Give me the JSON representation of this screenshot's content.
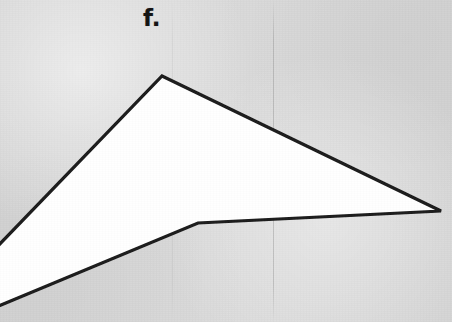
{
  "canvas": {
    "width": 452,
    "height": 322,
    "background_color": "#d8d8d8",
    "description": "Scanned worksheet page region showing one labeled geometric figure"
  },
  "label": {
    "text": "f.",
    "x": 143,
    "y": 7,
    "font_size_px": 23,
    "bold": true,
    "color": "#131313"
  },
  "figure": {
    "name": "concave-quadrilateral",
    "fill_color": "#ffffff",
    "stroke_color": "#1a1a1a",
    "stroke_width": 3.2,
    "clipped_at_left_edge": true,
    "points": [
      {
        "name": "left-upper-edge-exit",
        "x": -34,
        "y": 279
      },
      {
        "name": "apex-top",
        "x": 162,
        "y": 76
      },
      {
        "name": "right-point",
        "x": 441,
        "y": 211
      },
      {
        "name": "reflex-notch",
        "x": 198,
        "y": 223
      },
      {
        "name": "bottom-left-exit",
        "x": -40,
        "y": 322
      }
    ],
    "points_path": "-34,279 162,76 441,211 198,223 -40,322"
  },
  "background_marks": [
    {
      "name": "fold-crease-left",
      "x": 172,
      "color": "rgba(110,110,110,0.20)",
      "opacity": 0.5
    },
    {
      "name": "fold-crease-center",
      "x": 273,
      "color": "rgba(110,110,110,0.34)",
      "opacity": 0.85
    }
  ]
}
